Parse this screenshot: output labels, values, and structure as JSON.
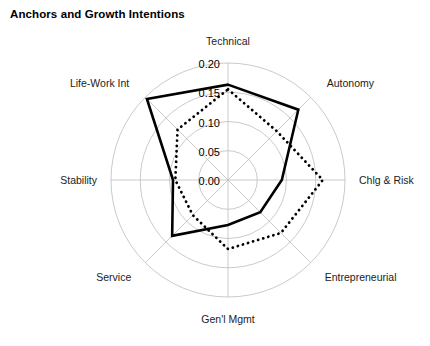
{
  "chart_data": {
    "type": "radar",
    "title": "Anchors and Growth Intentions",
    "xlabel": "",
    "ylabel": "",
    "rlim": [
      0.0,
      0.2
    ],
    "rticks": [
      "0.00",
      "0.05",
      "0.10",
      "0.15",
      "0.20"
    ],
    "rtick_values": [
      0.0,
      0.05,
      0.1,
      0.15,
      0.2
    ],
    "grid": true,
    "legend_position": "none",
    "categories": [
      "Technical",
      "Autonomy",
      "Chlg & Risk",
      "Entrepreneurial",
      "Gen'l Mgmt",
      "Service",
      "Stability",
      "Life-Work Int"
    ],
    "series": [
      {
        "name": "solid",
        "style": "solid",
        "color": "#000000",
        "values": [
          0.163,
          0.17,
          0.092,
          0.078,
          0.077,
          0.135,
          0.094,
          0.196
        ]
      },
      {
        "name": "dotted",
        "style": "dotted",
        "color": "#000000",
        "values": [
          0.155,
          0.118,
          0.162,
          0.128,
          0.118,
          0.085,
          0.09,
          0.122
        ]
      }
    ]
  },
  "axis_label_offsets": [
    {
      "dx": 0,
      "dy": -18,
      "anchor": "middle"
    },
    {
      "dx": 16,
      "dy": -10,
      "anchor": "start"
    },
    {
      "dx": 14,
      "dy": 4,
      "anchor": "start"
    },
    {
      "dx": 14,
      "dy": 18,
      "anchor": "start"
    },
    {
      "dx": 0,
      "dy": 26,
      "anchor": "middle"
    },
    {
      "dx": -14,
      "dy": 18,
      "anchor": "end"
    },
    {
      "dx": -14,
      "dy": 4,
      "anchor": "end"
    },
    {
      "dx": -16,
      "dy": -10,
      "anchor": "end"
    }
  ]
}
